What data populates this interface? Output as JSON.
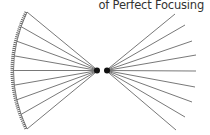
{
  "diagram": {
    "caption": "of Perfect Focusing",
    "ray_count": 9,
    "colors": {
      "ray": "#555555",
      "mirror": "#666666",
      "focus": "#111111",
      "caption": "#333333"
    }
  }
}
